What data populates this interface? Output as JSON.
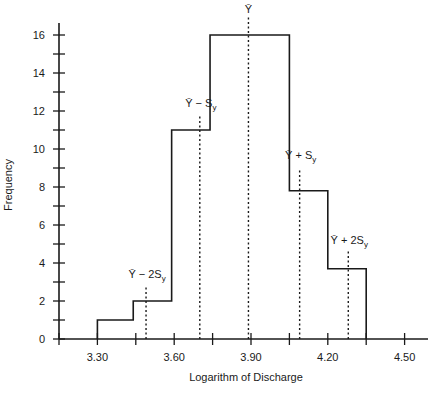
{
  "chart_data": {
    "type": "bar",
    "subtype": "histogram",
    "title": "",
    "xlabel": "Logarithm of Discharge",
    "ylabel": "Frequency",
    "xlim": [
      3.15,
      4.63
    ],
    "ylim": [
      0,
      16.5
    ],
    "x_ticks": [
      3.15,
      3.3,
      3.45,
      3.6,
      3.75,
      3.9,
      4.05,
      4.2,
      4.35,
      4.5
    ],
    "x_tick_labels": [
      "3.30",
      "3.60",
      "3.90",
      "4.20",
      "4.50"
    ],
    "x_tick_label_values": [
      3.3,
      3.6,
      3.9,
      4.2,
      4.5
    ],
    "y_ticks": [
      0,
      1,
      2,
      3,
      4,
      5,
      6,
      7,
      8,
      9,
      10,
      11,
      12,
      13,
      14,
      15,
      16
    ],
    "y_tick_labels": [
      "0",
      "2",
      "4",
      "6",
      "8",
      "10",
      "12",
      "14",
      "16"
    ],
    "y_tick_label_values": [
      0,
      2,
      4,
      6,
      8,
      10,
      12,
      14,
      16
    ],
    "grid": false,
    "legend": null,
    "bins": [
      {
        "start": 3.3,
        "end": 3.44,
        "value": 1
      },
      {
        "start": 3.44,
        "end": 3.59,
        "value": 2
      },
      {
        "start": 3.59,
        "end": 3.74,
        "value": 11
      },
      {
        "start": 3.74,
        "end": 3.89,
        "value": 16
      },
      {
        "start": 3.89,
        "end": 4.05,
        "value": 16
      },
      {
        "start": 4.05,
        "end": 4.2,
        "value": 7.8
      },
      {
        "start": 4.2,
        "end": 4.35,
        "value": 3.7
      }
    ],
    "categories": [
      "3.30-3.44",
      "3.44-3.59",
      "3.59-3.74",
      "3.74-3.89",
      "3.89-4.05",
      "4.05-4.20",
      "4.20-4.35"
    ],
    "values": [
      1,
      2,
      11,
      16,
      16,
      7.8,
      3.7
    ],
    "annotations": [
      {
        "label": "Ȳ − 2S",
        "sub": "y",
        "x": 3.49,
        "line_top": 2.8,
        "text_y": 3.2
      },
      {
        "label": "Ȳ − S",
        "sub": "y",
        "x": 3.7,
        "line_top": 11.8,
        "text_y": 12.2
      },
      {
        "label": "Ȳ",
        "sub": "",
        "x": 3.89,
        "line_top": 17.0,
        "text_y": 17.3
      },
      {
        "label": "Ȳ + S",
        "sub": "y",
        "x": 4.09,
        "line_top": 9.0,
        "text_y": 9.5
      },
      {
        "label": "Ȳ + 2S",
        "sub": "y",
        "x": 4.28,
        "line_top": 4.6,
        "text_y": 5.0
      }
    ]
  }
}
